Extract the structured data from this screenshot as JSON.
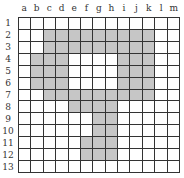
{
  "grid": {
    "columns": [
      "a",
      "b",
      "c",
      "d",
      "e",
      "f",
      "g",
      "h",
      "i",
      "j",
      "k",
      "l",
      "m"
    ],
    "rows": [
      "1",
      "2",
      "3",
      "4",
      "5",
      "6",
      "7",
      "8",
      "9",
      "10",
      "11",
      "12",
      "13"
    ],
    "shaded_color": "#c6c6c6",
    "shaded_cells": {
      "2": [
        "c",
        "d",
        "e",
        "f",
        "g",
        "h",
        "i",
        "j",
        "k"
      ],
      "3": [
        "c",
        "d",
        "e",
        "f",
        "g",
        "h",
        "i",
        "j",
        "k"
      ],
      "4": [
        "b",
        "c",
        "d",
        "i",
        "j",
        "k"
      ],
      "5": [
        "b",
        "c",
        "d",
        "i",
        "j",
        "k"
      ],
      "6": [
        "b",
        "c",
        "d",
        "i",
        "j",
        "k"
      ],
      "7": [
        "c",
        "d",
        "e",
        "f",
        "g",
        "h",
        "i",
        "j",
        "k"
      ],
      "8": [
        "e",
        "f",
        "g",
        "h"
      ],
      "9": [
        "g",
        "h"
      ],
      "10": [
        "g",
        "h"
      ],
      "11": [
        "f",
        "g",
        "h"
      ],
      "12": [
        "f",
        "g",
        "h"
      ]
    }
  }
}
